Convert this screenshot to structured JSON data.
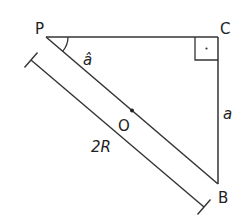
{
  "diagram": {
    "type": "geometry",
    "colors": {
      "stroke": "#333333",
      "text": "#222222",
      "background": "#ffffff"
    },
    "vertices": {
      "P": {
        "label": "P",
        "x": 46,
        "y": 37
      },
      "C": {
        "label": "C",
        "x": 218,
        "y": 37
      },
      "B": {
        "label": "B",
        "x": 218,
        "y": 184
      },
      "O": {
        "label": "O",
        "x": 132,
        "y": 110.5
      }
    },
    "labels": {
      "angle_P": "â",
      "side_CB": "a",
      "hypotenuse": "2R"
    },
    "right_angle_at": "C",
    "angle_marked_at": "P"
  }
}
